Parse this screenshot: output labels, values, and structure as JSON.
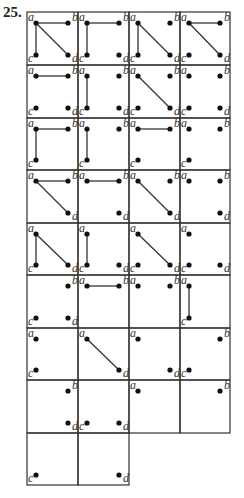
{
  "problem_number": "25.",
  "grid": {
    "left": 27,
    "top": 12,
    "col_edges": [
      27,
      78,
      129,
      180,
      230
    ],
    "row_edges": [
      12,
      65,
      118,
      170,
      223,
      275,
      328,
      380,
      433,
      485
    ]
  },
  "vertex_labels": {
    "a": "a",
    "b": "b",
    "c": "c",
    "d": "d"
  },
  "cells": [
    {
      "row": 0,
      "col": 0,
      "vertices": [
        "a",
        "b",
        "c",
        "d"
      ],
      "edges": [
        [
          "a",
          "b"
        ],
        [
          "a",
          "c"
        ],
        [
          "a",
          "d"
        ]
      ]
    },
    {
      "row": 0,
      "col": 1,
      "vertices": [
        "a",
        "b",
        "c",
        "d"
      ],
      "edges": [
        [
          "a",
          "b"
        ],
        [
          "a",
          "c"
        ]
      ]
    },
    {
      "row": 0,
      "col": 2,
      "vertices": [
        "a",
        "b",
        "c",
        "d"
      ],
      "edges": [
        [
          "a",
          "c"
        ],
        [
          "a",
          "d"
        ]
      ]
    },
    {
      "row": 0,
      "col": 3,
      "vertices": [
        "a",
        "b",
        "c",
        "d"
      ],
      "edges": [
        [
          "a",
          "b"
        ],
        [
          "a",
          "d"
        ]
      ]
    },
    {
      "row": 1,
      "col": 0,
      "vertices": [
        "a",
        "b",
        "c",
        "d"
      ],
      "edges": [
        [
          "a",
          "b"
        ]
      ]
    },
    {
      "row": 1,
      "col": 1,
      "vertices": [
        "a",
        "b",
        "c",
        "d"
      ],
      "edges": [
        [
          "a",
          "c"
        ]
      ]
    },
    {
      "row": 1,
      "col": 2,
      "vertices": [
        "a",
        "b",
        "c",
        "d"
      ],
      "edges": [
        [
          "a",
          "d"
        ]
      ]
    },
    {
      "row": 1,
      "col": 3,
      "vertices": [
        "a",
        "b",
        "c",
        "d"
      ],
      "edges": []
    },
    {
      "row": 2,
      "col": 0,
      "vertices": [
        "a",
        "b",
        "c"
      ],
      "edges": [
        [
          "a",
          "b"
        ],
        [
          "a",
          "c"
        ]
      ]
    },
    {
      "row": 2,
      "col": 1,
      "vertices": [
        "a",
        "b",
        "c"
      ],
      "edges": [
        [
          "a",
          "c"
        ]
      ]
    },
    {
      "row": 2,
      "col": 2,
      "vertices": [
        "a",
        "b",
        "c"
      ],
      "edges": [
        [
          "a",
          "b"
        ]
      ]
    },
    {
      "row": 2,
      "col": 3,
      "vertices": [
        "a",
        "b",
        "c"
      ],
      "edges": []
    },
    {
      "row": 3,
      "col": 0,
      "vertices": [
        "a",
        "b",
        "d"
      ],
      "edges": [
        [
          "a",
          "b"
        ],
        [
          "a",
          "d"
        ]
      ]
    },
    {
      "row": 3,
      "col": 1,
      "vertices": [
        "a",
        "b",
        "d"
      ],
      "edges": [
        [
          "a",
          "b"
        ]
      ]
    },
    {
      "row": 3,
      "col": 2,
      "vertices": [
        "a",
        "b",
        "d"
      ],
      "edges": [
        [
          "a",
          "d"
        ]
      ]
    },
    {
      "row": 3,
      "col": 3,
      "vertices": [
        "a",
        "b",
        "d"
      ],
      "edges": []
    },
    {
      "row": 4,
      "col": 0,
      "vertices": [
        "a",
        "c",
        "d"
      ],
      "edges": [
        [
          "a",
          "c"
        ],
        [
          "a",
          "d"
        ]
      ]
    },
    {
      "row": 4,
      "col": 1,
      "vertices": [
        "a",
        "c",
        "d"
      ],
      "edges": [
        [
          "a",
          "c"
        ]
      ]
    },
    {
      "row": 4,
      "col": 2,
      "vertices": [
        "a",
        "c",
        "d"
      ],
      "edges": [
        [
          "a",
          "d"
        ]
      ]
    },
    {
      "row": 4,
      "col": 3,
      "vertices": [
        "a",
        "c",
        "d"
      ],
      "edges": []
    },
    {
      "row": 5,
      "col": 0,
      "vertices": [
        "b",
        "c",
        "d"
      ],
      "edges": []
    },
    {
      "row": 5,
      "col": 1,
      "vertices": [
        "a",
        "b"
      ],
      "edges": [
        [
          "a",
          "b"
        ]
      ]
    },
    {
      "row": 5,
      "col": 2,
      "vertices": [
        "a",
        "b"
      ],
      "edges": []
    },
    {
      "row": 5,
      "col": 3,
      "vertices": [
        "a",
        "c"
      ],
      "edges": [
        [
          "a",
          "c"
        ]
      ]
    },
    {
      "row": 6,
      "col": 0,
      "vertices": [
        "a",
        "c"
      ],
      "edges": []
    },
    {
      "row": 6,
      "col": 1,
      "vertices": [
        "a",
        "d"
      ],
      "edges": [
        [
          "a",
          "d"
        ]
      ]
    },
    {
      "row": 6,
      "col": 2,
      "vertices": [
        "a",
        "d"
      ],
      "edges": []
    },
    {
      "row": 6,
      "col": 3,
      "vertices": [
        "b",
        "c"
      ],
      "edges": []
    },
    {
      "row": 7,
      "col": 0,
      "vertices": [
        "b",
        "d"
      ],
      "edges": []
    },
    {
      "row": 7,
      "col": 1,
      "vertices": [
        "c",
        "d"
      ],
      "edges": []
    },
    {
      "row": 7,
      "col": 2,
      "vertices": [
        "a"
      ],
      "edges": []
    },
    {
      "row": 7,
      "col": 3,
      "vertices": [
        "b"
      ],
      "edges": []
    },
    {
      "row": 8,
      "col": 0,
      "vertices": [
        "c"
      ],
      "edges": []
    },
    {
      "row": 8,
      "col": 1,
      "vertices": [
        "d"
      ],
      "edges": []
    }
  ]
}
